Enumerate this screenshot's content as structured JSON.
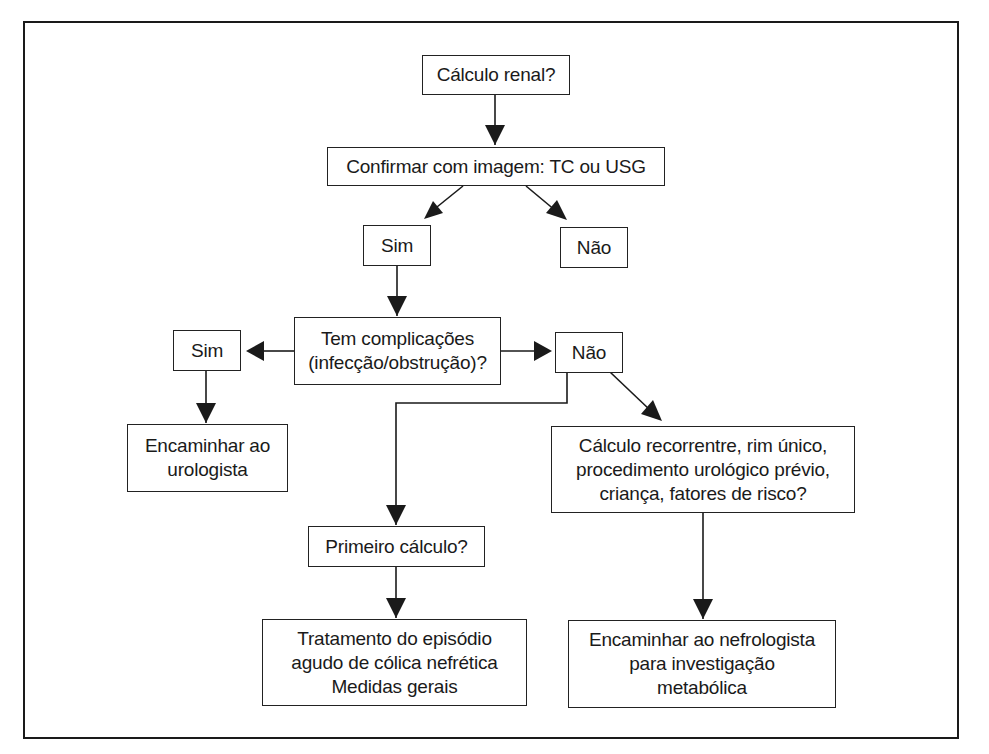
{
  "diagram": {
    "type": "flowchart",
    "language": "pt-BR",
    "nodes": {
      "n1": "Cálculo renal?",
      "n2": "Confirmar com imagem: TC ou USG",
      "n3": "Sim",
      "n4": "Não",
      "n5": "Tem complicações\n(infecção/obstrução)?",
      "n6": "Sim",
      "n7": "Não",
      "n8": "Encaminhar ao\nurologista",
      "n9": "Cálculo recorrentre, rim único,\nprocedimento urológico prévio,\ncriança, fatores de risco?",
      "n10": "Primeiro cálculo?",
      "n11": "Tratamento do episódio\nagudo de cólica nefrética\nMedidas gerais",
      "n12": "Encaminhar ao nefrologista\npara investigação\nmetabólica"
    },
    "edges": [
      {
        "from": "n1",
        "to": "n2"
      },
      {
        "from": "n2",
        "to": "n3"
      },
      {
        "from": "n2",
        "to": "n4"
      },
      {
        "from": "n3",
        "to": "n5"
      },
      {
        "from": "n5",
        "to": "n6"
      },
      {
        "from": "n5",
        "to": "n7"
      },
      {
        "from": "n6",
        "to": "n8"
      },
      {
        "from": "n7",
        "to": "n9"
      },
      {
        "from": "n7",
        "to": "n10"
      },
      {
        "from": "n10",
        "to": "n11"
      },
      {
        "from": "n9",
        "to": "n12"
      }
    ],
    "colors": {
      "stroke": "#1a1a1a",
      "background": "#ffffff"
    }
  }
}
